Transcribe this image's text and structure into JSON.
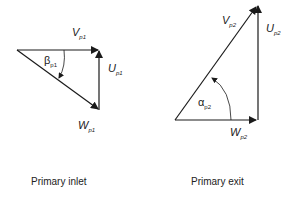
{
  "diagram": {
    "inlet": {
      "caption": "Primary inlet",
      "vectors": {
        "V": {
          "symbol": "V",
          "subscript": "p1"
        },
        "U": {
          "symbol": "U",
          "subscript": "p1"
        },
        "W": {
          "symbol": "W",
          "subscript": "p1"
        }
      },
      "angle": {
        "symbol": "β",
        "subscript": "p1"
      }
    },
    "exit": {
      "caption": "Primary exit",
      "vectors": {
        "V": {
          "symbol": "V",
          "subscript": "p2"
        },
        "U": {
          "symbol": "U",
          "subscript": "p2"
        },
        "W": {
          "symbol": "W",
          "subscript": "p2"
        }
      },
      "angle": {
        "symbol": "α",
        "subscript": "p2"
      }
    },
    "colors": {
      "line": "#1a1a1a",
      "background": "#ffffff"
    }
  }
}
